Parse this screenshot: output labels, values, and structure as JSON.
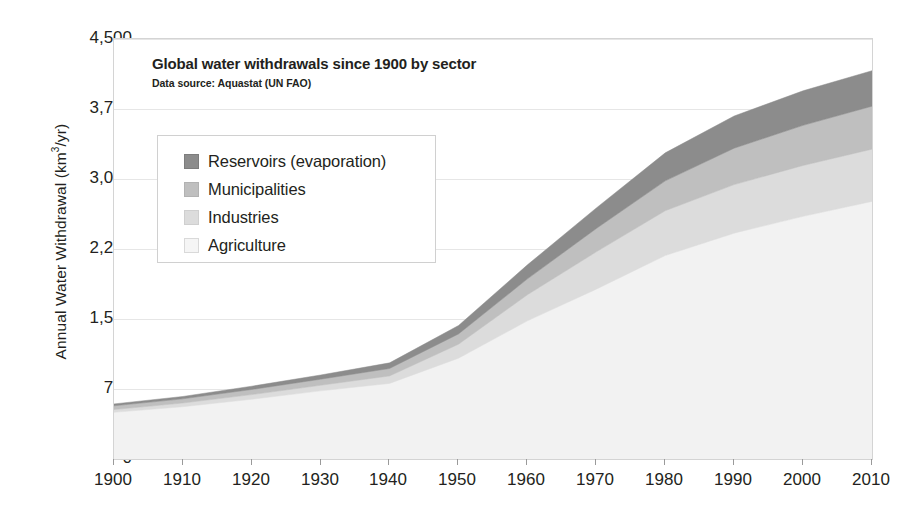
{
  "chart_data": {
    "type": "area",
    "stacked": true,
    "title": "Global water withdrawals since 1900 by sector",
    "subtitle": "Data source: Aquastat (UN FAO)",
    "xlabel": "",
    "ylabel": "Annual Water Withdrawal (km³/yr)",
    "xlim": [
      1900,
      2010
    ],
    "ylim": [
      0,
      4500
    ],
    "ytick_labels": [
      "4,500",
      "3,750",
      "3,000",
      "2,250",
      "1,500",
      "750",
      "0"
    ],
    "ytick_values": [
      4500,
      3750,
      3000,
      2250,
      1500,
      750,
      0
    ],
    "xtick_labels": [
      "1900",
      "1910",
      "1920",
      "1930",
      "1940",
      "1950",
      "1960",
      "1970",
      "1980",
      "1990",
      "2000",
      "2010"
    ],
    "xtick_values": [
      1900,
      1910,
      1920,
      1930,
      1940,
      1950,
      1960,
      1970,
      1980,
      1990,
      2000,
      2010
    ],
    "grid": true,
    "grid_axis": "y",
    "legend_position": "upper-left-inset",
    "x": [
      1900,
      1910,
      1920,
      1930,
      1940,
      1950,
      1960,
      1970,
      1980,
      1990,
      2000,
      2010
    ],
    "series": [
      {
        "name": "Agriculture",
        "color": "#f2f2f2",
        "order": 1,
        "values": [
          500,
          560,
          640,
          730,
          810,
          1080,
          1480,
          1820,
          2180,
          2420,
          2600,
          2760
        ]
      },
      {
        "name": "Industries",
        "color": "#dcdcdc",
        "order": 2,
        "values": [
          30,
          40,
          50,
          60,
          80,
          150,
          280,
          400,
          480,
          520,
          545,
          560
        ]
      },
      {
        "name": "Municipalities",
        "color": "#bfbfbf",
        "order": 3,
        "values": [
          40,
          45,
          55,
          65,
          80,
          110,
          170,
          250,
          320,
          390,
          430,
          460
        ]
      },
      {
        "name": "Reservoirs (evaporation)",
        "color": "#8c8c8c",
        "order": 4,
        "values": [
          20,
          25,
          35,
          45,
          60,
          90,
          150,
          220,
          300,
          345,
          370,
          380
        ]
      }
    ],
    "totals": [
      590,
      670,
      780,
      900,
      1030,
      1430,
      2080,
      2690,
      3280,
      3675,
      3945,
      4160
    ]
  },
  "legend": {
    "items": [
      {
        "label": "Reservoirs (evaporation)",
        "color": "#8c8c8c"
      },
      {
        "label": "Municipalities",
        "color": "#bfbfbf"
      },
      {
        "label": "Industries",
        "color": "#dcdcdc"
      },
      {
        "label": "Agriculture",
        "color": "#f5f5f5"
      }
    ]
  },
  "style": {
    "axis_color": "#9a9a9a",
    "grid_color": "#e6e6e6",
    "frame_color": "#d4d4d4",
    "text_color": "#231f20",
    "background": "#ffffff"
  }
}
